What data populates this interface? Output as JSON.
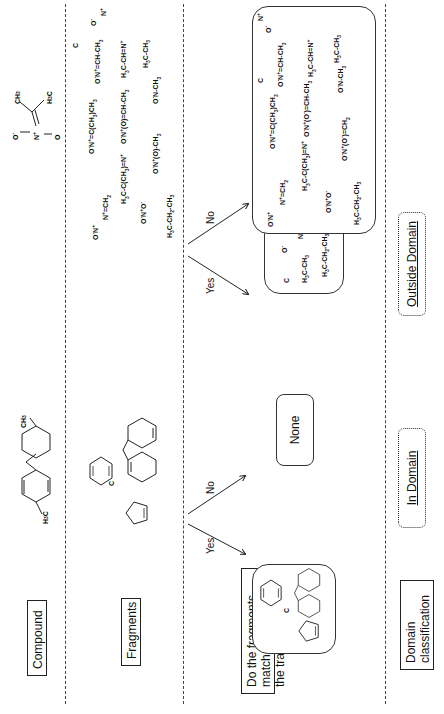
{
  "rows": {
    "compound": {
      "label": "Compound"
    },
    "fragments": {
      "label": "Fragments"
    },
    "question": {
      "label_line1": "Do the fragments match",
      "label_line2": "the training data?"
    },
    "domain": {
      "label_line1": "Domain",
      "label_line2": "classification"
    }
  },
  "compounds": {
    "in_domain": {
      "name": "2,7-dimethylfluorene",
      "substituents": [
        "H3C",
        "CH3"
      ]
    },
    "out_domain": {
      "name": "nitro-alkene compound",
      "atoms": [
        "O-",
        "N+",
        "O",
        "CH3",
        "H3C"
      ]
    }
  },
  "fragments_in": {
    "items": [
      "C",
      "benzene",
      "cyclopentadiene",
      "fluorene"
    ]
  },
  "fragments_out": {
    "items": [
      "C",
      "O-",
      "N+",
      "O-N+=CH-CH3",
      "H3C-CH=N+",
      "H3C-CH3",
      "O-N+(=C(CH3)CH3)",
      "O-N+(O-)=CH-CH3",
      "O-N-CH3",
      "N+=CH2",
      "H3C-C(CH3)=N+",
      "O-N+",
      "O-N+-O-",
      "O-N+(O)-CH3",
      "H3C-CH2-CH3"
    ]
  },
  "edges": {
    "yes": "Yes",
    "no": "No"
  },
  "results": {
    "in_yes": {
      "items": [
        "C",
        "benzene",
        "cyclopentadiene",
        "fluorene"
      ]
    },
    "in_no": {
      "label": "None"
    },
    "out_yes": {
      "items": [
        "C",
        "O-",
        "N+",
        "O-N+",
        "H3C-CH3",
        "H3C-CH2-CH3"
      ]
    },
    "out_no": {
      "items": [
        "O-",
        "N+",
        "C",
        "O-N+=CH-CH3",
        "H3C-CH=N+",
        "H3C-CH3",
        "O-N+=C(CH3)CH3",
        "O-N+(O-)=CH-CH3",
        "O-N-CH3",
        "N+=CH2",
        "H3C-C(CH3)=N+",
        "O-N+",
        "O-N+-O-",
        "O-N+(O-)=CH2",
        "H3C-CH2-CH3"
      ]
    }
  },
  "classification": {
    "in_domain": "In Domain",
    "outside_domain": "Outside Domain"
  }
}
